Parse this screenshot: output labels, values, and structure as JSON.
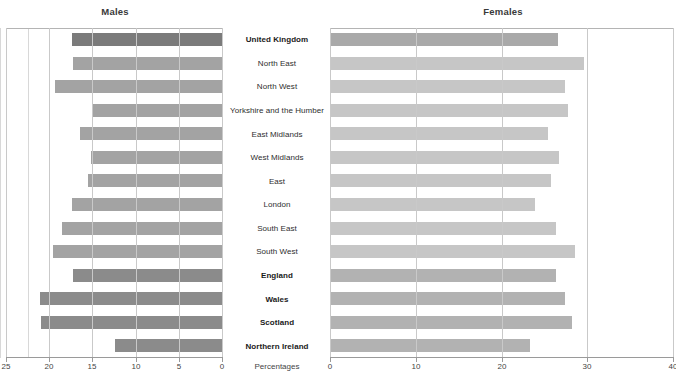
{
  "headers": {
    "left": "Males",
    "right": "Females"
  },
  "axis_caption": "Percentages",
  "colors": {
    "bar_uk_left": "#7b7b7b",
    "bar_region_left": "#a3a3a3",
    "bar_country_left": "#8b8b8b",
    "bar_uk_right": "#a9a9a9",
    "bar_region_right": "#c6c6c6",
    "bar_country_right": "#b2b2b2",
    "grid": "#c9c9c9",
    "axis": "#9a9a9a",
    "text": "#2e2e2e"
  },
  "chart_data": {
    "type": "bar",
    "title": "",
    "subtitle": "",
    "xlabel": "Percentages",
    "ylabel": "",
    "orientation": "horizontal-diverging",
    "grid": true,
    "legend_position": "top",
    "categories": [
      "United Kingdom",
      "North East",
      "North West",
      "Yorkshire and the Humber",
      "East Midlands",
      "West Midlands",
      "East",
      "London",
      "South East",
      "South West",
      "England",
      "Wales",
      "Scotland",
      "Northern Ireland"
    ],
    "emphasis": [
      true,
      false,
      false,
      false,
      false,
      false,
      false,
      false,
      false,
      false,
      true,
      true,
      true,
      true
    ],
    "series": [
      {
        "name": "Males",
        "side": "left",
        "axis": {
          "ticks": [
            25,
            20,
            15,
            10,
            5,
            0
          ],
          "min": 0,
          "max": 25,
          "reversed": true
        },
        "values": [
          17.4,
          17.2,
          19.3,
          15.0,
          16.4,
          15.2,
          15.5,
          17.4,
          18.5,
          19.6,
          17.2,
          21.1,
          21.0,
          12.4
        ]
      },
      {
        "name": "Females",
        "side": "right",
        "axis": {
          "ticks": [
            0,
            10,
            20,
            30,
            40
          ],
          "min": 0,
          "max": 40,
          "reversed": false
        },
        "values": [
          26.6,
          29.6,
          27.4,
          27.7,
          25.4,
          26.7,
          25.8,
          23.9,
          26.4,
          28.6,
          26.3,
          27.4,
          28.2,
          23.3
        ]
      }
    ]
  }
}
